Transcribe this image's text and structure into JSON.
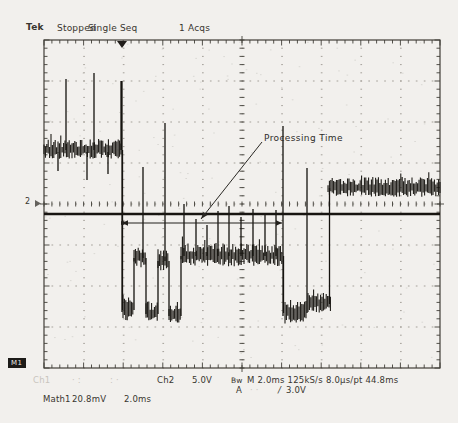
{
  "header": {
    "logo": "Tek",
    "status": "Stopped",
    "mode": "Single Seq",
    "acquisitions": "1 Acqs"
  },
  "annotation": {
    "label": "Processing Time"
  },
  "markers": {
    "ch2": "2",
    "math1": "M1"
  },
  "readouts": {
    "row1": {
      "faded": [
        "Ch1",
        "· :",
        ": ·"
      ],
      "ch2_label": "Ch2",
      "ch2_scale": "5.0V",
      "bandwidth": "Bw",
      "timebase": "M 2.0ms 125kS/s",
      "resolution": "8.0µs/pt 44.8ms"
    },
    "trigger": {
      "source": "A",
      "faded": "· ·",
      "slope": "/",
      "level": "3.0V"
    },
    "math": {
      "label": "Math1",
      "scale": "20.8mV",
      "timebase": "2.0ms"
    }
  },
  "colors": {
    "background": "#f2f0ed",
    "ink": "#38352f",
    "trace": "#15130f",
    "grid_dot": "#a5a19a",
    "tick": "#413e38",
    "faded_text": "#c9c5bd"
  },
  "screen": {
    "graticule": {
      "x": 44,
      "y": 40,
      "width": 396,
      "height": 328,
      "h_div": 10,
      "v_div": 8,
      "minor": 5
    },
    "trigger_marker_x": 122,
    "ch2_marker_y": 203,
    "flat_trace": {
      "y": 214
    },
    "measure_arrow": {
      "x1": 122,
      "x2": 282,
      "y": 223
    },
    "callout_arrow": {
      "x1": 262,
      "y1": 142,
      "x2": 201,
      "y2": 219
    },
    "bands": [
      {
        "x1": 44,
        "x2": 122,
        "y": 150,
        "amp": 11
      },
      {
        "x1": 123,
        "x2": 134,
        "y": 310,
        "amp": 13
      },
      {
        "x1": 134,
        "x2": 146,
        "y": 258,
        "amp": 12
      },
      {
        "x1": 146,
        "x2": 158,
        "y": 314,
        "amp": 13
      },
      {
        "x1": 158,
        "x2": 169,
        "y": 261,
        "amp": 12
      },
      {
        "x1": 169,
        "x2": 181,
        "y": 316,
        "amp": 12
      },
      {
        "x1": 181,
        "x2": 282,
        "y": 256,
        "amp": 13
      },
      {
        "x1": 285,
        "x2": 306,
        "y": 313,
        "amp": 13
      },
      {
        "x1": 308,
        "x2": 331,
        "y": 304,
        "amp": 11
      },
      {
        "x1": 328,
        "x2": 440,
        "y": 188,
        "amp": 11
      }
    ],
    "spikes": [
      {
        "x": 66,
        "y1": 150,
        "y2": 79
      },
      {
        "x": 94,
        "y1": 150,
        "y2": 73
      },
      {
        "x": 121,
        "y1": 150,
        "y2": 81
      },
      {
        "x": 122,
        "y1": 81,
        "y2": 312
      },
      {
        "x": 58,
        "y1": 152,
        "y2": 171
      },
      {
        "x": 87,
        "y1": 152,
        "y2": 180
      },
      {
        "x": 108,
        "y1": 152,
        "y2": 174
      },
      {
        "x": 143,
        "y1": 258,
        "y2": 167
      },
      {
        "x": 165,
        "y1": 261,
        "y2": 123
      },
      {
        "x": 184,
        "y1": 256,
        "y2": 204
      },
      {
        "x": 196,
        "y1": 256,
        "y2": 219
      },
      {
        "x": 207,
        "y1": 256,
        "y2": 225
      },
      {
        "x": 218,
        "y1": 256,
        "y2": 211
      },
      {
        "x": 229,
        "y1": 256,
        "y2": 206
      },
      {
        "x": 241,
        "y1": 256,
        "y2": 217
      },
      {
        "x": 253,
        "y1": 256,
        "y2": 209
      },
      {
        "x": 265,
        "y1": 256,
        "y2": 214
      },
      {
        "x": 276,
        "y1": 256,
        "y2": 210
      },
      {
        "x": 283,
        "y1": 316,
        "y2": 126
      },
      {
        "x": 307,
        "y1": 313,
        "y2": 168
      }
    ]
  }
}
